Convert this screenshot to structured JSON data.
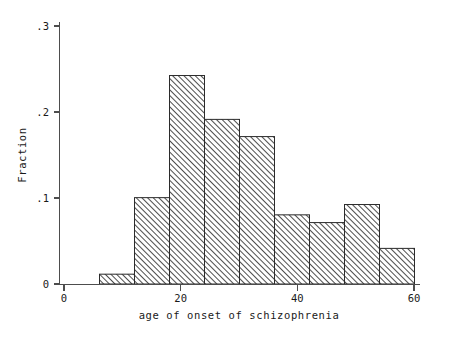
{
  "chart_data": {
    "type": "bar",
    "title": "",
    "subtitle": "",
    "xlabel": "age of onset of schizophrenia",
    "ylabel": "Fraction",
    "xlim": [
      0,
      60
    ],
    "ylim": [
      0,
      0.3
    ],
    "xticks": [
      0,
      20,
      40,
      60
    ],
    "xtick_labels": [
      "0",
      "20",
      "40",
      "60"
    ],
    "yticks": [
      0,
      0.1,
      0.2,
      0.3
    ],
    "ytick_labels": [
      "0",
      ".1",
      ".2",
      ".3"
    ],
    "grid": false,
    "legend": null,
    "bin_width": 6,
    "bin_edges": [
      6,
      12,
      18,
      24,
      30,
      36,
      42,
      48,
      54,
      60
    ],
    "bins": [
      {
        "x0": 6,
        "x1": 12,
        "value": 0.012
      },
      {
        "x0": 12,
        "x1": 18,
        "value": 0.101
      },
      {
        "x0": 18,
        "x1": 24,
        "value": 0.243
      },
      {
        "x0": 24,
        "x1": 30,
        "value": 0.192
      },
      {
        "x0": 30,
        "x1": 36,
        "value": 0.172
      },
      {
        "x0": 36,
        "x1": 42,
        "value": 0.081
      },
      {
        "x0": 42,
        "x1": 48,
        "value": 0.072
      },
      {
        "x0": 48,
        "x1": 54,
        "value": 0.093
      },
      {
        "x0": 54,
        "x1": 60,
        "value": 0.042
      }
    ],
    "categories": [
      "6-12",
      "12-18",
      "18-24",
      "24-30",
      "30-36",
      "36-42",
      "42-48",
      "48-54",
      "54-60"
    ],
    "values": [
      0.012,
      0.101,
      0.243,
      0.192,
      0.172,
      0.081,
      0.072,
      0.093,
      0.042
    ],
    "bar_fill": "diagonal-hatch",
    "bar_edge_color": "#2b2b2b",
    "axis_color": "#4d4d4d",
    "background_color": "#ffffff"
  }
}
